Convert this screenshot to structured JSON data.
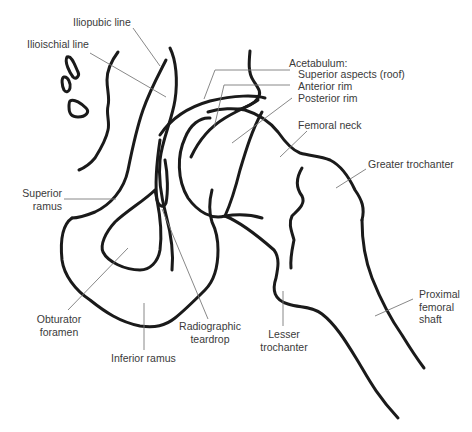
{
  "figure": {
    "colors": {
      "outline": "#1a1a1a",
      "leader": "#7a7a7a",
      "text": "#3a3a3a",
      "background": "#ffffff"
    }
  },
  "labels": {
    "iliopubic_line": "Iliopubic line",
    "ilioischial_line": "Ilioischial line",
    "acetabulum_header": "Acetabulum:",
    "superior_aspects": "Superior aspects (roof)",
    "anterior_rim": "Anterior rim",
    "posterior_rim": "Posterior rim",
    "femoral_neck": "Femoral neck",
    "greater_trochanter": "Greater trochanter",
    "superior_ramus_1": "Superior",
    "superior_ramus_2": "ramus",
    "obturator_foramen_1": "Obturator",
    "obturator_foramen_2": "foramen",
    "radiographic_teardrop_1": "Radiographic",
    "radiographic_teardrop_2": "teardrop",
    "inferior_ramus": "Inferior ramus",
    "lesser_trochanter_1": "Lesser",
    "lesser_trochanter_2": "trochanter",
    "proximal_femoral_shaft_1": "Proximal",
    "proximal_femoral_shaft_2": "femoral",
    "proximal_femoral_shaft_3": "shaft"
  }
}
